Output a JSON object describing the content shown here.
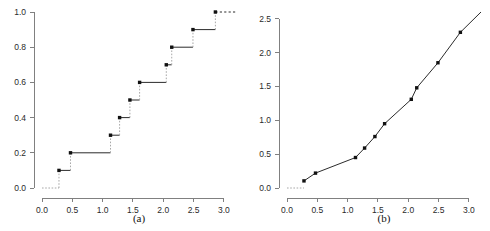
{
  "figure": {
    "panels": [
      {
        "id": "a",
        "caption": "(a)",
        "plot_type": "step",
        "x_ticks": [
          "0.0",
          "0.5",
          "1.0",
          "1.5",
          "2.0",
          "2.5",
          "3.0"
        ],
        "y_ticks": [
          "0.0",
          "0.2",
          "0.4",
          "0.6",
          "0.8",
          "1.0"
        ]
      },
      {
        "id": "b",
        "caption": "(b)",
        "plot_type": "line",
        "x_ticks": [
          "0.0",
          "0.5",
          "1.0",
          "1.5",
          "2.0",
          "2.5",
          "3.0"
        ],
        "y_ticks": [
          "0.0",
          "0.5",
          "1.0",
          "1.5",
          "2.0",
          "2.5"
        ]
      }
    ]
  },
  "chart_data": [
    {
      "type": "line",
      "subtype": "step-function",
      "title": "",
      "caption": "(a)",
      "xlabel": "",
      "ylabel": "",
      "xlim": [
        0.0,
        3.2
      ],
      "ylim": [
        0.0,
        1.0
      ],
      "xticks": [
        0.0,
        0.5,
        1.0,
        1.5,
        2.0,
        2.5,
        3.0
      ],
      "yticks": [
        0.0,
        0.2,
        0.4,
        0.6,
        0.8,
        1.0
      ],
      "grid": false,
      "legend": null,
      "step_direction": "post",
      "x": [
        0.28,
        0.47,
        1.13,
        1.28,
        1.45,
        1.61,
        2.05,
        2.14,
        2.49,
        2.86
      ],
      "y": [
        0.1,
        0.2,
        0.3,
        0.4,
        0.5,
        0.6,
        0.7,
        0.8,
        0.9,
        1.0
      ],
      "baseline_y": 0.0,
      "tail_extends_to": 3.2,
      "marker": "filled-square",
      "riser_style": "dotted",
      "tread_style": "solid"
    },
    {
      "type": "line",
      "subtype": "piecewise-linear-with-jumps",
      "title": "",
      "caption": "(b)",
      "xlabel": "",
      "ylabel": "",
      "xlim": [
        0.0,
        3.2
      ],
      "ylim": [
        0.0,
        2.6
      ],
      "xticks": [
        0.0,
        0.5,
        1.0,
        1.5,
        2.0,
        2.5,
        3.0
      ],
      "yticks": [
        0.0,
        0.5,
        1.0,
        1.5,
        2.0,
        2.5
      ],
      "grid": false,
      "legend": null,
      "x": [
        0.28,
        0.47,
        1.13,
        1.28,
        1.45,
        1.61,
        2.05,
        2.14,
        2.49,
        2.86
      ],
      "y": [
        0.105,
        0.22,
        0.45,
        0.59,
        0.76,
        0.95,
        1.31,
        1.48,
        1.85,
        2.3
      ],
      "baseline_y": 0.0,
      "tail_extends_to": 3.2,
      "tail_end_y": 2.6,
      "marker": "filled-square",
      "segment_style": "solid"
    }
  ]
}
